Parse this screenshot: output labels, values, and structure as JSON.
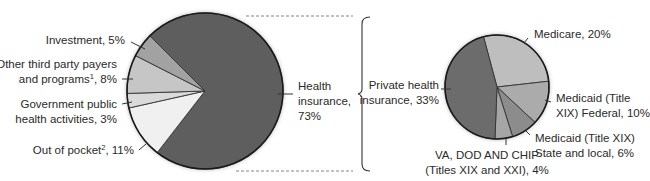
{
  "chart_data": [
    {
      "type": "pie",
      "title": "",
      "start_angle_deg": 315,
      "direction": "clockwise",
      "center": [
        205,
        91
      ],
      "radius": 78,
      "slices": [
        {
          "label": "Health insurance",
          "value": 73,
          "color": "#5e5e5e"
        },
        {
          "label": "Out of pocket",
          "value": 11,
          "color": "#f0f0f0",
          "footnote": "2"
        },
        {
          "label": "Government public health activities",
          "value": 3,
          "color": "#dadada"
        },
        {
          "label": "Other third party payers and programs",
          "value": 8,
          "color": "#c6c6c6",
          "footnote": "1"
        },
        {
          "label": "Investment",
          "value": 5,
          "color": "#a2a2a2"
        }
      ]
    },
    {
      "type": "pie",
      "title": "",
      "start_angle_deg": 345,
      "direction": "clockwise",
      "center": [
        497,
        87
      ],
      "radius": 52,
      "total": 73,
      "slices": [
        {
          "label": "Medicare",
          "value": 20,
          "color": "#bebebe"
        },
        {
          "label": "Medicaid (Title XIX) Federal",
          "value": 10,
          "color": "#ababab"
        },
        {
          "label": "Medicaid (Title XIX) State and local",
          "value": 6,
          "color": "#8c8c8c"
        },
        {
          "label": "VA, DOD AND CHIP (Titles XIX and XXI)",
          "value": 4,
          "color": "#a6a6a6"
        },
        {
          "label": "Private health insurance",
          "value": 33,
          "color": "#6c6c6c"
        }
      ]
    }
  ],
  "labels": {
    "investment": "Investment, 5%",
    "other_line1": "Other third party payers",
    "other_line2a": "and programs",
    "other_sup": "1",
    "other_line2b": ", 8%",
    "gov_line1": "Government public",
    "gov_line2": "health activities, 3%",
    "oop_a": "Out of pocket",
    "oop_sup": "2",
    "oop_b": ", 11%",
    "health_line1": "Health",
    "health_line2": "insurance,",
    "health_line3": "73%",
    "private_line1": "Private health",
    "private_line2": "insurance, 33%",
    "medicare": "Medicare, 20%",
    "medicaid_fed_line1": "Medicaid (Title",
    "medicaid_fed_line2": "XIX) Federal, 10%",
    "medicaid_state_line1": "Medicaid (Title XIX)",
    "medicaid_state_line2": "State and local, 6%",
    "va_line1": "VA, DOD AND CHIP",
    "va_line2": "(Titles XIX and XXI), 4%"
  }
}
